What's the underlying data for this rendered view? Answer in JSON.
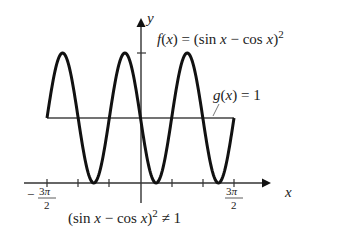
{
  "chart_data": {
    "type": "line",
    "title": "",
    "xlabel": "x",
    "ylabel": "y",
    "xlim": [
      -4.712389,
      4.712389
    ],
    "ylim": [
      0,
      2
    ],
    "grid": false,
    "legend": "none (inline annotations)",
    "x_ticks": [
      "-3π/2",
      "-π",
      "-π/2",
      "0",
      "π/2",
      "π",
      "3π/2"
    ],
    "x_tick_labels_shown": [
      "-3π/2",
      "3π/2"
    ],
    "y_ticks": [
      2
    ],
    "series": [
      {
        "name": "f(x) = (sin x − cos x)^2",
        "expression": "(sin x - cos x)^2 = 1 - sin 2x",
        "x": [
          -4.7124,
          -3.927,
          -3.1416,
          -2.3562,
          -1.5708,
          -0.7854,
          0,
          0.7854,
          1.5708,
          2.3562,
          3.1416,
          3.927,
          4.7124
        ],
        "values": [
          1,
          2,
          1,
          0,
          1,
          2,
          1,
          0,
          1,
          2,
          1,
          0,
          1
        ]
      },
      {
        "name": "g(x) = 1",
        "expression": "1",
        "x": [
          -4.7124,
          4.7124
        ],
        "values": [
          1,
          1
        ]
      }
    ],
    "annotations": [
      "f(x) = (sin x − cos x)^2",
      "g(x) = 1",
      "(sin x − cos x)^2 ≠ 1"
    ]
  },
  "labels": {
    "y_axis": "y",
    "x_axis": "x",
    "f_name": "f(x) = (sin x − cos x)",
    "f_exp": "2",
    "g_label": "g(x) = 1",
    "tick_left_num": "3π",
    "tick_left_sign": "−",
    "tick_den": "2",
    "tick_right_num": "3π",
    "caption_main": "(sin x − cos x)",
    "caption_exp": "2",
    "caption_tail": " ≠ 1"
  },
  "colors": {
    "curve": "#111111",
    "axes": "#333333",
    "g_line": "#444444",
    "text": "#222222"
  }
}
